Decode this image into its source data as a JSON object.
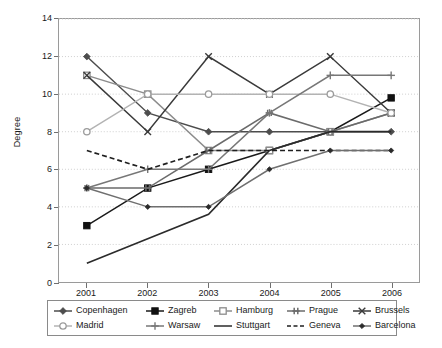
{
  "chart_data": {
    "type": "line",
    "title": "",
    "xlabel": "",
    "ylabel": "Degree",
    "categories": [
      "2001",
      "2002",
      "2003",
      "2004",
      "2005",
      "2006"
    ],
    "ylim": [
      0,
      14
    ],
    "yticks": [
      0,
      2,
      4,
      6,
      8,
      10,
      12,
      14
    ],
    "grid": "horizontal dotted gridlines",
    "legend_position": "below plot, boxed, 2 rows x 5 columns",
    "series": [
      {
        "name": "Copenhagen",
        "marker": "diamond",
        "color": "#4d4d4d",
        "values": [
          12,
          9,
          8,
          8,
          8,
          8
        ]
      },
      {
        "name": "Zagreb",
        "marker": "filled-square",
        "color": "#1a1a1a",
        "values": [
          3,
          5,
          6,
          7,
          8,
          9.8
        ]
      },
      {
        "name": "Hamburg",
        "marker": "open-square",
        "color": "#8c8c8c",
        "values": [
          11,
          10,
          7,
          7,
          8,
          9
        ]
      },
      {
        "name": "Prague",
        "marker": "cross-bar",
        "color": "#6b6b6b",
        "values": [
          5,
          5,
          7,
          9,
          8,
          9
        ]
      },
      {
        "name": "Brussels",
        "marker": "x-cross",
        "color": "#3a3a3a",
        "values": [
          11,
          8,
          12,
          10,
          12,
          9
        ]
      },
      {
        "name": "Madrid",
        "marker": "open-circle",
        "color": "#b3b3b3",
        "values": [
          8,
          10,
          10,
          10,
          10,
          9
        ]
      },
      {
        "name": "Warsaw",
        "marker": "plus",
        "color": "#777777",
        "values": [
          5,
          6,
          6,
          9,
          11,
          11
        ]
      },
      {
        "name": "Stuttgart",
        "marker": "none",
        "color": "#2b2b2b",
        "values": [
          1,
          2.3,
          3.6,
          7,
          8,
          8
        ]
      },
      {
        "name": "Geneva",
        "marker": "none-dashed",
        "color": "#1f1f1f",
        "values": [
          7,
          6,
          7,
          7,
          7,
          7
        ]
      },
      {
        "name": "Barcelona",
        "marker": "small-diamond",
        "color": "#6f6f6f",
        "values": [
          5,
          4,
          4,
          6,
          7,
          7
        ]
      }
    ]
  },
  "axes": {
    "y_title": "Degree",
    "y_tick_labels": [
      "14",
      "12",
      "10",
      "8",
      "6",
      "4",
      "2",
      "0"
    ],
    "x_tick_labels": [
      "2001",
      "2002",
      "2003",
      "2004",
      "2005",
      "2006"
    ]
  },
  "legend": {
    "items": [
      {
        "label": "Copenhagen"
      },
      {
        "label": "Zagreb"
      },
      {
        "label": "Hamburg"
      },
      {
        "label": "Prague"
      },
      {
        "label": "Brussels"
      },
      {
        "label": "Madrid"
      },
      {
        "label": "Warsaw"
      },
      {
        "label": "Stuttgart"
      },
      {
        "label": "Geneva"
      },
      {
        "label": "Barcelona"
      }
    ]
  },
  "colors": {
    "frame": "#9a9a9a",
    "grid": "#cfcfcf",
    "background": "#ffffff",
    "text": "#1a1a1a"
  }
}
